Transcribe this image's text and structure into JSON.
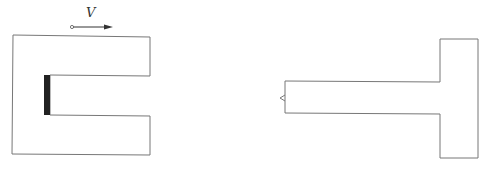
{
  "diagram": {
    "velocity_label": "V",
    "left_shape": "C-shaped conductor with dark bar at inner end",
    "right_shape": "T-shaped plate with small notch on left edge",
    "colors": {
      "line": "#666666",
      "bar": "#222222",
      "arrow": "#333333"
    }
  }
}
